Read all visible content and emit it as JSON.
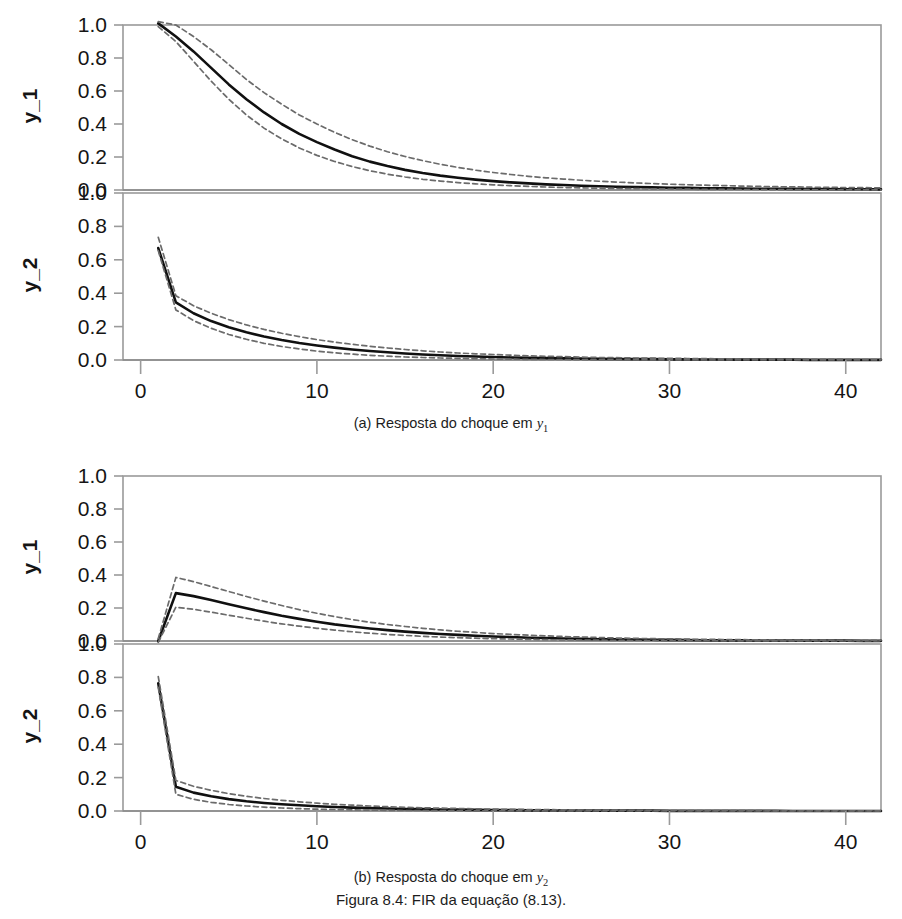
{
  "figure": {
    "caption": "Figura 8.4: FIR da equação (8.13).",
    "caption_number": "8.4",
    "subfigures": [
      {
        "id": "a",
        "caption_prefix": "(a) Resposta do choque em",
        "caption_var": "y",
        "caption_var_sub": "1"
      },
      {
        "id": "b",
        "caption_prefix": "(b) Resposta do choque em",
        "caption_var": "y",
        "caption_var_sub": "2"
      }
    ]
  },
  "axes": {
    "y_labels": [
      "y_1",
      "y_2"
    ],
    "yticks": [
      "1.0",
      "0.8",
      "0.6",
      "0.4",
      "0.2",
      "0.0"
    ],
    "xticks": [
      "0",
      "10",
      "20",
      "30",
      "40"
    ],
    "ylim": [
      0.0,
      1.0
    ],
    "xlim": [
      -1,
      42
    ]
  },
  "colors": {
    "line": "#101010",
    "band": "#6b6b6b",
    "zero": "#8a8a8a",
    "frame": "#9a9a9a",
    "text": "#151515",
    "background": "#ffffff"
  },
  "chart_data": {
    "type": "line",
    "title": "Figura 8.4: FIR da equação (8.13).",
    "xlabel": "",
    "ylabel": "",
    "grid": false,
    "legend": null,
    "xlim": [
      -1,
      42
    ],
    "ylim": [
      0.0,
      1.0
    ],
    "xticks": [
      0,
      10,
      20,
      30,
      40
    ],
    "yticks": [
      0.0,
      0.2,
      0.4,
      0.6,
      0.8,
      1.0
    ],
    "panels": [
      {
        "subfigure": "a",
        "panel_label": "y_1",
        "description": "Resposta de y_1 ao choque em y_1",
        "x": [
          1,
          2,
          3,
          4,
          5,
          6,
          7,
          8,
          9,
          10,
          11,
          12,
          13,
          14,
          15,
          16,
          17,
          18,
          19,
          20,
          21,
          22,
          23,
          24,
          25,
          26,
          27,
          28,
          29,
          30,
          31,
          32,
          33,
          34,
          35,
          36,
          37,
          38,
          39,
          40,
          41,
          42
        ],
        "series": [
          {
            "name": "point estimate",
            "style": "solid",
            "values": [
              1.01,
              0.93,
              0.84,
              0.74,
              0.64,
              0.55,
              0.47,
              0.4,
              0.34,
              0.29,
              0.245,
              0.205,
              0.172,
              0.145,
              0.122,
              0.103,
              0.087,
              0.074,
              0.063,
              0.054,
              0.046,
              0.04,
              0.034,
              0.03,
              0.026,
              0.023,
              0.02,
              0.018,
              0.016,
              0.014,
              0.013,
              0.011,
              0.01,
              0.009,
              0.008,
              0.008,
              0.007,
              0.006,
              0.006,
              0.005,
              0.005,
              0.004
            ]
          },
          {
            "name": "upper confidence band",
            "style": "dashed",
            "values": [
              1.02,
              1.0,
              0.93,
              0.85,
              0.76,
              0.67,
              0.59,
              0.52,
              0.455,
              0.4,
              0.35,
              0.305,
              0.266,
              0.232,
              0.203,
              0.178,
              0.156,
              0.137,
              0.12,
              0.106,
              0.094,
              0.083,
              0.074,
              0.066,
              0.059,
              0.053,
              0.048,
              0.043,
              0.039,
              0.035,
              0.032,
              0.029,
              0.027,
              0.024,
              0.022,
              0.02,
              0.019,
              0.017,
              0.016,
              0.015,
              0.014,
              0.013
            ]
          },
          {
            "name": "lower confidence band",
            "style": "dashed",
            "values": [
              0.99,
              0.9,
              0.78,
              0.66,
              0.55,
              0.455,
              0.375,
              0.31,
              0.255,
              0.21,
              0.173,
              0.142,
              0.117,
              0.096,
              0.079,
              0.065,
              0.054,
              0.045,
              0.037,
              0.031,
              0.026,
              0.022,
              0.018,
              0.015,
              0.013,
              0.011,
              0.009,
              0.008,
              0.007,
              0.006,
              0.005,
              0.004,
              0.004,
              0.003,
              0.003,
              0.002,
              0.002,
              0.002,
              0.001,
              0.001,
              0.001,
              0.001
            ]
          }
        ]
      },
      {
        "subfigure": "a",
        "panel_label": "y_2",
        "description": "Resposta de y_2 ao choque em y_1",
        "x": [
          1,
          2,
          3,
          4,
          5,
          6,
          7,
          8,
          9,
          10,
          11,
          12,
          13,
          14,
          15,
          16,
          17,
          18,
          19,
          20,
          21,
          22,
          23,
          24,
          25,
          26,
          27,
          28,
          29,
          30,
          31,
          32,
          33,
          34,
          35,
          36,
          37,
          38,
          39,
          40,
          41,
          42
        ],
        "series": [
          {
            "name": "point estimate",
            "style": "solid",
            "values": [
              0.67,
              0.345,
              0.28,
              0.233,
              0.196,
              0.166,
              0.141,
              0.12,
              0.102,
              0.087,
              0.074,
              0.063,
              0.054,
              0.046,
              0.039,
              0.033,
              0.028,
              0.024,
              0.021,
              0.018,
              0.015,
              0.013,
              0.011,
              0.01,
              0.008,
              0.007,
              0.006,
              0.005,
              0.005,
              0.004,
              0.004,
              0.003,
              0.003,
              0.002,
              0.002,
              0.002,
              0.002,
              0.001,
              0.001,
              0.001,
              0.001,
              0.001
            ]
          },
          {
            "name": "upper confidence band",
            "style": "dashed",
            "values": [
              0.735,
              0.385,
              0.325,
              0.28,
              0.242,
              0.21,
              0.183,
              0.16,
              0.14,
              0.122,
              0.107,
              0.094,
              0.082,
              0.072,
              0.063,
              0.055,
              0.048,
              0.042,
              0.037,
              0.033,
              0.029,
              0.025,
              0.022,
              0.02,
              0.017,
              0.015,
              0.014,
              0.012,
              0.011,
              0.01,
              0.009,
              0.008,
              0.007,
              0.006,
              0.006,
              0.005,
              0.005,
              0.004,
              0.004,
              0.003,
              0.003,
              0.003
            ]
          },
          {
            "name": "lower confidence band",
            "style": "dashed",
            "values": [
              0.655,
              0.3,
              0.236,
              0.19,
              0.153,
              0.124,
              0.1,
              0.081,
              0.066,
              0.053,
              0.043,
              0.035,
              0.028,
              0.023,
              0.018,
              0.015,
              0.012,
              0.01,
              0.008,
              0.006,
              0.005,
              0.004,
              0.003,
              0.003,
              0.002,
              0.002,
              0.001,
              0.001,
              0.001,
              0.001,
              0.001,
              0.0,
              0.0,
              0.0,
              0.0,
              0.0,
              0.0,
              0.0,
              0.0,
              0.0,
              0.0,
              0.0
            ]
          }
        ]
      },
      {
        "subfigure": "b",
        "panel_label": "y_1",
        "description": "Resposta de y_1 ao choque em y_2",
        "x": [
          1,
          2,
          3,
          4,
          5,
          6,
          7,
          8,
          9,
          10,
          11,
          12,
          13,
          14,
          15,
          16,
          17,
          18,
          19,
          20,
          21,
          22,
          23,
          24,
          25,
          26,
          27,
          28,
          29,
          30,
          31,
          32,
          33,
          34,
          35,
          36,
          37,
          38,
          39,
          40,
          41,
          42
        ],
        "series": [
          {
            "name": "point estimate",
            "style": "solid",
            "values": [
              0.0,
              0.29,
              0.272,
              0.248,
              0.223,
              0.198,
              0.175,
              0.153,
              0.134,
              0.117,
              0.101,
              0.088,
              0.076,
              0.066,
              0.057,
              0.049,
              0.042,
              0.037,
              0.032,
              0.027,
              0.024,
              0.02,
              0.018,
              0.015,
              0.013,
              0.011,
              0.01,
              0.009,
              0.008,
              0.007,
              0.006,
              0.005,
              0.004,
              0.004,
              0.003,
              0.003,
              0.003,
              0.002,
              0.002,
              0.002,
              0.001,
              0.001
            ]
          },
          {
            "name": "upper confidence band",
            "style": "dashed",
            "values": [
              0.015,
              0.385,
              0.36,
              0.33,
              0.3,
              0.27,
              0.242,
              0.215,
              0.19,
              0.168,
              0.148,
              0.13,
              0.114,
              0.1,
              0.088,
              0.077,
              0.067,
              0.059,
              0.052,
              0.045,
              0.04,
              0.035,
              0.031,
              0.027,
              0.024,
              0.021,
              0.018,
              0.016,
              0.014,
              0.013,
              0.011,
              0.01,
              0.009,
              0.008,
              0.007,
              0.006,
              0.006,
              0.005,
              0.005,
              0.004,
              0.004,
              0.003
            ]
          },
          {
            "name": "lower confidence band",
            "style": "dashed",
            "values": [
              -0.008,
              0.205,
              0.192,
              0.175,
              0.156,
              0.138,
              0.12,
              0.104,
              0.09,
              0.077,
              0.066,
              0.056,
              0.047,
              0.04,
              0.034,
              0.028,
              0.024,
              0.02,
              0.017,
              0.014,
              0.012,
              0.01,
              0.008,
              0.007,
              0.006,
              0.005,
              0.004,
              0.003,
              0.003,
              0.002,
              0.002,
              0.002,
              0.001,
              0.001,
              0.001,
              0.001,
              0.001,
              0.0,
              0.0,
              0.0,
              0.0,
              0.0
            ]
          }
        ]
      },
      {
        "subfigure": "b",
        "panel_label": "y_2",
        "description": "Resposta de y_2 ao choque em y_2",
        "x": [
          1,
          2,
          3,
          4,
          5,
          6,
          7,
          8,
          9,
          10,
          11,
          12,
          13,
          14,
          15,
          16,
          17,
          18,
          19,
          20,
          21,
          22,
          23,
          24,
          25,
          26,
          27,
          28,
          29,
          30,
          31,
          32,
          33,
          34,
          35,
          36,
          37,
          38,
          39,
          40,
          41,
          42
        ],
        "series": [
          {
            "name": "point estimate",
            "style": "solid",
            "values": [
              0.765,
              0.145,
              0.11,
              0.088,
              0.071,
              0.058,
              0.048,
              0.04,
              0.034,
              0.028,
              0.024,
              0.02,
              0.017,
              0.015,
              0.012,
              0.011,
              0.009,
              0.008,
              0.007,
              0.006,
              0.005,
              0.004,
              0.004,
              0.003,
              0.003,
              0.002,
              0.002,
              0.002,
              0.002,
              0.001,
              0.001,
              0.001,
              0.001,
              0.001,
              0.001,
              0.001,
              0.0,
              0.0,
              0.0,
              0.0,
              0.0,
              0.0
            ]
          },
          {
            "name": "upper confidence band",
            "style": "dashed",
            "values": [
              0.805,
              0.183,
              0.148,
              0.124,
              0.104,
              0.088,
              0.075,
              0.064,
              0.055,
              0.047,
              0.04,
              0.035,
              0.03,
              0.026,
              0.022,
              0.019,
              0.017,
              0.015,
              0.013,
              0.011,
              0.01,
              0.009,
              0.008,
              0.007,
              0.006,
              0.005,
              0.005,
              0.004,
              0.004,
              0.003,
              0.003,
              0.002,
              0.002,
              0.002,
              0.002,
              0.001,
              0.001,
              0.001,
              0.001,
              0.001,
              0.001,
              0.001
            ]
          },
          {
            "name": "lower confidence band",
            "style": "dashed",
            "values": [
              0.74,
              0.1,
              0.07,
              0.052,
              0.039,
              0.03,
              0.023,
              0.018,
              0.014,
              0.011,
              0.009,
              0.007,
              0.005,
              0.004,
              0.003,
              0.003,
              0.002,
              0.002,
              0.001,
              0.001,
              0.001,
              0.001,
              0.0,
              0.0,
              0.0,
              0.0,
              0.0,
              0.0,
              0.0,
              0.0,
              0.0,
              0.0,
              0.0,
              0.0,
              0.0,
              0.0,
              0.0,
              0.0,
              0.0,
              0.0,
              0.0,
              0.0
            ]
          }
        ]
      }
    ]
  }
}
